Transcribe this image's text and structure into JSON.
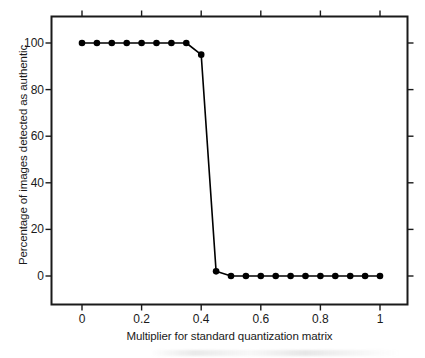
{
  "chart_data": {
    "type": "line",
    "title": "",
    "xlabel": "Multiplier for standard quantization matrix",
    "ylabel": "Percentage of images detected as authentic",
    "xlim": [
      0,
      1
    ],
    "ylim": [
      0,
      100
    ],
    "grid": false,
    "legend": "none",
    "marker": "filled-circle",
    "x_ticks": [
      "0",
      "0.2",
      "0.4",
      "0.6",
      "0.8",
      "1"
    ],
    "x_tick_values": [
      0,
      0.2,
      0.4,
      0.6,
      0.8,
      1
    ],
    "y_ticks": [
      "0",
      "20",
      "40",
      "60",
      "80",
      "100"
    ],
    "y_tick_values": [
      0,
      20,
      40,
      60,
      80,
      100
    ],
    "series": [
      {
        "name": "Percentage detected as authentic",
        "color": "#000000",
        "x": [
          0,
          0.05,
          0.1,
          0.15,
          0.2,
          0.25,
          0.3,
          0.35,
          0.4,
          0.45,
          0.5,
          0.55,
          0.6,
          0.65,
          0.7,
          0.75,
          0.8,
          0.85,
          0.9,
          0.95,
          1.0
        ],
        "values": [
          100,
          100,
          100,
          100,
          100,
          100,
          100,
          100,
          95,
          2,
          0,
          0,
          0,
          0,
          0,
          0,
          0,
          0,
          0,
          0,
          0
        ]
      }
    ]
  },
  "axes": {
    "frame_color": "#1a1a1a",
    "line_color": "#000000",
    "marker_color": "#000000"
  }
}
